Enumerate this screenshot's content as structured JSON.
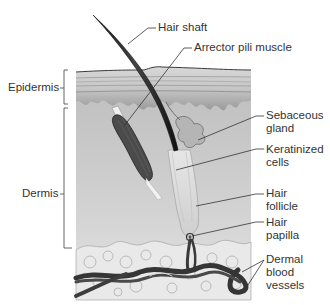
{
  "figure": {
    "colors": {
      "background": "#ffffff",
      "dermis": "#c9c9c9",
      "epidermis_layers": "#b5b5b5",
      "epidermis_basal": "#6e6e6e",
      "hair": "#2a2a2a",
      "muscle": "#4a4a4a",
      "follicle": "#d8d8d8",
      "vessels": "#3a3a3a",
      "label_text": "#333333",
      "leader_lines": "#333333"
    }
  },
  "labels": {
    "left": {
      "epidermis": "Epidermis",
      "dermis": "Dermis"
    },
    "right": {
      "hair_shaft": "Hair shaft",
      "arrector_pili_muscle": "Arrector pili muscle",
      "sebaceous_gland": [
        "Sebaceous",
        "gland"
      ],
      "keratinized_cells": [
        "Keratinized",
        "cells"
      ],
      "hair_follicle": [
        "Hair",
        "follicle"
      ],
      "hair_papilla": [
        "Hair",
        "papilla"
      ],
      "dermal_blood_vessels": [
        "Dermal",
        "blood",
        "vessels"
      ]
    }
  }
}
